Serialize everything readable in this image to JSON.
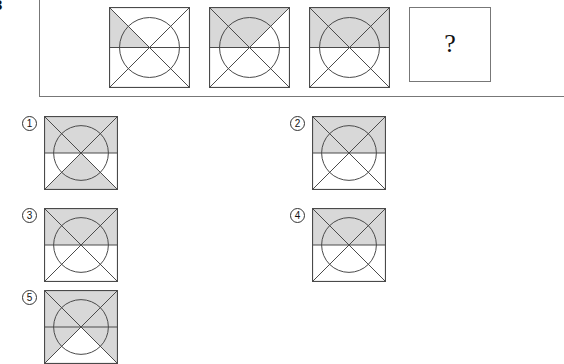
{
  "question_number": "3",
  "stem": {
    "panel_name": "question-stem-panel",
    "cells": [
      {
        "id": "stem-1",
        "position": 1,
        "shaded_regions": [
          "top-left-triangle"
        ],
        "has_circle": true,
        "has_diagonals": true,
        "has_horizontal_midline": true
      },
      {
        "id": "stem-2",
        "position": 2,
        "shaded_regions": [
          "top-left-triangle",
          "top-middle-triangle"
        ],
        "has_circle": true,
        "has_diagonals": true,
        "has_horizontal_midline": true
      },
      {
        "id": "stem-3",
        "position": 3,
        "shaded_regions": [
          "top-left-triangle",
          "top-middle-triangle",
          "top-right-triangle"
        ],
        "has_circle": true,
        "has_diagonals": true,
        "has_horizontal_midline": true
      }
    ],
    "answer_cell": {
      "id": "answer-placeholder",
      "glyph": "?"
    }
  },
  "options": [
    {
      "id": "option-1",
      "label": "①",
      "number": 1,
      "shaded_regions": [
        "top-left-triangle",
        "top-middle-triangle",
        "top-right-triangle",
        "bottom-middle-triangle"
      ],
      "has_circle": true,
      "has_diagonals": true,
      "has_horizontal_midline": true
    },
    {
      "id": "option-2",
      "label": "②",
      "number": 2,
      "shaded_regions": [
        "top-left-triangle",
        "top-middle-triangle",
        "top-right-triangle"
      ],
      "has_circle": true,
      "has_diagonals": true,
      "has_horizontal_midline": true
    },
    {
      "id": "option-3",
      "label": "③",
      "number": 3,
      "shaded_regions": [
        "top-left-triangle",
        "top-middle-triangle",
        "top-right-triangle"
      ],
      "has_circle": true,
      "has_diagonals": true,
      "has_horizontal_midline": true
    },
    {
      "id": "option-4",
      "label": "④",
      "number": 4,
      "shaded_regions": [
        "top-left-triangle",
        "top-middle-triangle",
        "top-right-triangle"
      ],
      "has_circle": true,
      "has_diagonals": true,
      "has_horizontal_midline": true
    },
    {
      "id": "option-5",
      "label": "⑤",
      "number": 5,
      "shaded_regions": [
        "top-left-triangle",
        "top-middle-triangle",
        "top-right-triangle",
        "bottom-left-triangle",
        "bottom-right-triangle"
      ],
      "has_circle": true,
      "has_diagonals": true,
      "has_horizontal_midline": true
    }
  ],
  "colors": {
    "shade": "#d8d8d8",
    "stroke": "#4a4a4a",
    "panel_border": "#777777",
    "text": "#111111",
    "background": "#ffffff"
  },
  "layout": {
    "stem_cell_size": 81,
    "stem_cell_x": [
      108,
      208,
      308
    ],
    "qmark_box": {
      "x": 409,
      "y": 7,
      "w": 82,
      "h": 75
    },
    "option_size": 74,
    "option_positions": [
      {
        "x": 22,
        "y": 116
      },
      {
        "x": 290,
        "y": 116
      },
      {
        "x": 22,
        "y": 208
      },
      {
        "x": 290,
        "y": 208
      },
      {
        "x": 22,
        "y": 290
      }
    ]
  }
}
